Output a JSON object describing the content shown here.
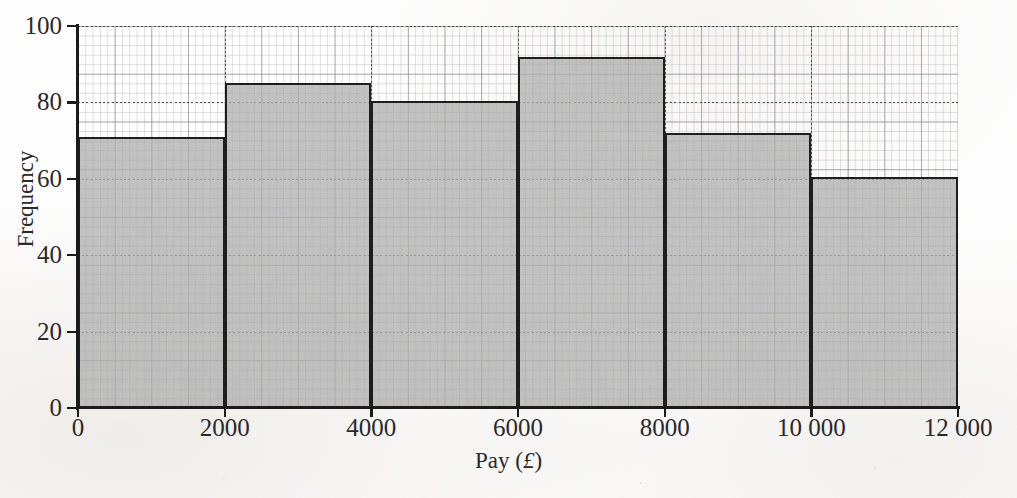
{
  "chart_data": {
    "type": "bar",
    "title": "",
    "subtitle": "",
    "xlabel": "Pay (£)",
    "xlabel_text": "Pay (",
    "xlabel_currency": "£",
    "xlabel_close": ")",
    "ylabel": "Frequency",
    "categories": [
      "0–2000",
      "2000–4000",
      "4000–6000",
      "6000–8000",
      "8000–10 000",
      "10 000–12 000"
    ],
    "bin_edges": [
      0,
      2000,
      4000,
      6000,
      8000,
      10000,
      12000
    ],
    "values": [
      71,
      85,
      80.5,
      92,
      72,
      60.5
    ],
    "xlim": [
      0,
      12000
    ],
    "ylim": [
      0,
      100
    ],
    "xticks": [
      0,
      2000,
      4000,
      6000,
      8000,
      10000,
      12000
    ],
    "xtick_labels": [
      "0",
      "2000",
      "4000",
      "6000",
      "8000",
      "10 000",
      "12 000"
    ],
    "yticks": [
      0,
      20,
      40,
      60,
      80,
      100
    ],
    "ytick_labels": [
      "0",
      "20",
      "40",
      "60",
      "80",
      "100"
    ],
    "grid": true,
    "grid_style": "graph-paper fine grid with dotted major gridlines",
    "legend": false,
    "legend_position": "none",
    "bar_fill_color": "#b0b0b0",
    "bar_edge_color": "#1e1e1e",
    "axis_color": "#1b1b1b",
    "background_color": "#fefefe"
  }
}
